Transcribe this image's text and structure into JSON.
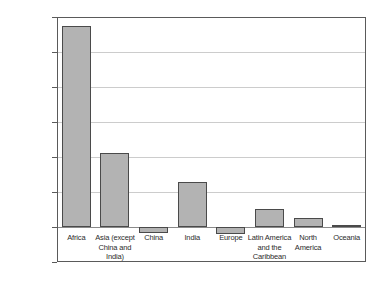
{
  "chart_data": {
    "type": "bar",
    "title": "",
    "xlabel": "",
    "ylabel": "",
    "ylim": [
      -200000,
      1200000
    ],
    "grid": true,
    "legend": "none",
    "orientation": "vertical",
    "bar_color": "#b3b3b3",
    "bar_edge_color": "#4a4a4a",
    "categories": [
      "Africa",
      "Asia (except China and India)",
      "China",
      "India",
      "Europe",
      "Latin America and the Caribbean",
      "North America",
      "Oceania"
    ],
    "values": [
      1148000,
      425000,
      -35000,
      258000,
      -38000,
      105000,
      53000,
      10000
    ],
    "ytick_labels": [
      "1,200,000",
      "1,000,000",
      "800,000",
      "600,000",
      "400,000",
      "200,000",
      "0",
      "-200,000"
    ],
    "ytick_values": [
      1200000,
      1000000,
      800000,
      600000,
      400000,
      200000,
      0,
      -200000
    ]
  },
  "axis": {
    "ticks": [
      {
        "label": "1,200,000",
        "value": 1200000
      },
      {
        "label": "1,000,000",
        "value": 1000000
      },
      {
        "label": "800,000",
        "value": 800000
      },
      {
        "label": "600,000",
        "value": 600000
      },
      {
        "label": "400,000",
        "value": 400000
      },
      {
        "label": "200,000",
        "value": 200000
      },
      {
        "label": "0",
        "value": 0
      },
      {
        "label": "-200,000",
        "value": -200000
      }
    ]
  },
  "categories": [
    {
      "label": "Africa",
      "lines": [
        "Africa"
      ]
    },
    {
      "label": "Asia (except China and India)",
      "lines": [
        "Asia (except",
        "China and",
        "India)"
      ]
    },
    {
      "label": "China",
      "lines": [
        "China"
      ]
    },
    {
      "label": "India",
      "lines": [
        "India"
      ]
    },
    {
      "label": "Europe",
      "lines": [
        "Europe"
      ]
    },
    {
      "label": "Latin America and the Caribbean",
      "lines": [
        "Latin America",
        "and the",
        "Caribbean"
      ]
    },
    {
      "label": "North America",
      "lines": [
        "North",
        "America"
      ]
    },
    {
      "label": "Oceania",
      "lines": [
        "Oceania"
      ]
    }
  ]
}
